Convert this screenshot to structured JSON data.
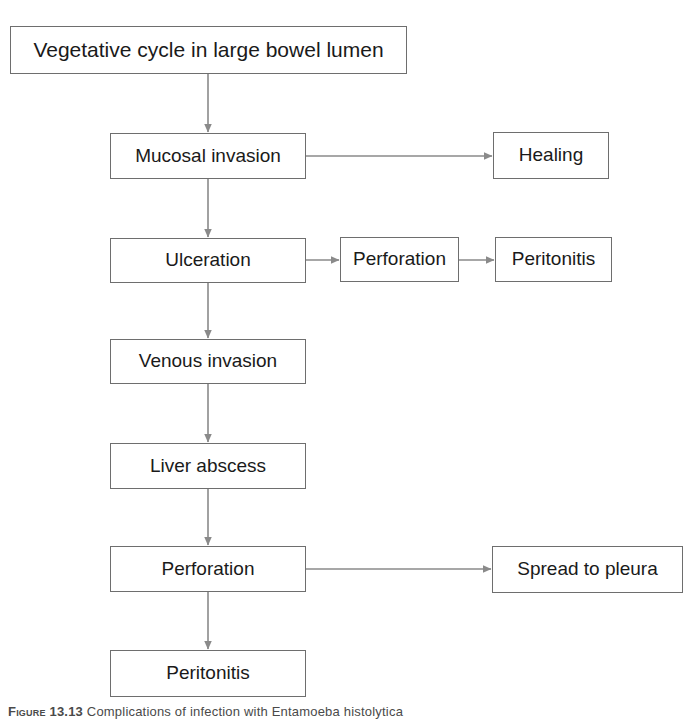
{
  "diagram": {
    "background_color": "#ffffff",
    "box_border_color": "#6e6e6e",
    "arrow_color": "#8a8a8a",
    "text_color": "#1a1a1a",
    "nodes": [
      {
        "id": "vegetative-cycle",
        "label": "Vegetative cycle in large bowel lumen",
        "x": 10,
        "y": 26,
        "w": 397,
        "h": 48,
        "font_size": 21
      },
      {
        "id": "mucosal-invasion",
        "label": "Mucosal invasion",
        "x": 110,
        "y": 133,
        "w": 196,
        "h": 46,
        "font_size": 19
      },
      {
        "id": "healing",
        "label": "Healing",
        "x": 493,
        "y": 132,
        "w": 116,
        "h": 47,
        "font_size": 19
      },
      {
        "id": "ulceration",
        "label": "Ulceration",
        "x": 110,
        "y": 238,
        "w": 196,
        "h": 45,
        "font_size": 19
      },
      {
        "id": "perforation-upper",
        "label": "Perforation",
        "x": 340,
        "y": 237,
        "w": 119,
        "h": 45,
        "font_size": 19
      },
      {
        "id": "peritonitis-upper",
        "label": "Peritonitis",
        "x": 495,
        "y": 237,
        "w": 117,
        "h": 45,
        "font_size": 19
      },
      {
        "id": "venous-invasion",
        "label": "Venous invasion",
        "x": 110,
        "y": 339,
        "w": 196,
        "h": 45,
        "font_size": 19
      },
      {
        "id": "liver-abscess",
        "label": "Liver abscess",
        "x": 110,
        "y": 443,
        "w": 196,
        "h": 46,
        "font_size": 19
      },
      {
        "id": "perforation-lower",
        "label": "Perforation",
        "x": 110,
        "y": 546,
        "w": 196,
        "h": 46,
        "font_size": 19
      },
      {
        "id": "spread-to-pleura",
        "label": "Spread to pleura",
        "x": 492,
        "y": 546,
        "w": 191,
        "h": 47,
        "font_size": 19
      },
      {
        "id": "peritonitis-lower",
        "label": "Peritonitis",
        "x": 110,
        "y": 650,
        "w": 196,
        "h": 47,
        "font_size": 19
      }
    ],
    "edges": [
      {
        "id": "vegetative-to-mucosal",
        "from": "vegetative-cycle",
        "to": "mucosal-invasion",
        "direction": "down"
      },
      {
        "id": "mucosal-to-healing",
        "from": "mucosal-invasion",
        "to": "healing",
        "direction": "right"
      },
      {
        "id": "mucosal-to-ulceration",
        "from": "mucosal-invasion",
        "to": "ulceration",
        "direction": "down"
      },
      {
        "id": "ulceration-to-perforation",
        "from": "ulceration",
        "to": "perforation-upper",
        "direction": "right"
      },
      {
        "id": "perforation-to-peritonitis",
        "from": "perforation-upper",
        "to": "peritonitis-upper",
        "direction": "right"
      },
      {
        "id": "ulceration-to-venous",
        "from": "ulceration",
        "to": "venous-invasion",
        "direction": "down"
      },
      {
        "id": "venous-to-liver",
        "from": "venous-invasion",
        "to": "liver-abscess",
        "direction": "down"
      },
      {
        "id": "liver-to-perforation",
        "from": "liver-abscess",
        "to": "perforation-lower",
        "direction": "down"
      },
      {
        "id": "perforation-to-pleura",
        "from": "perforation-lower",
        "to": "spread-to-pleura",
        "direction": "right"
      },
      {
        "id": "perforation-to-peritonitis-lower",
        "from": "perforation-lower",
        "to": "peritonitis-lower",
        "direction": "down"
      }
    ]
  },
  "caption": {
    "number": "Figure 13.13",
    "text": "Complications of infection with Entamoeba histolytica"
  }
}
